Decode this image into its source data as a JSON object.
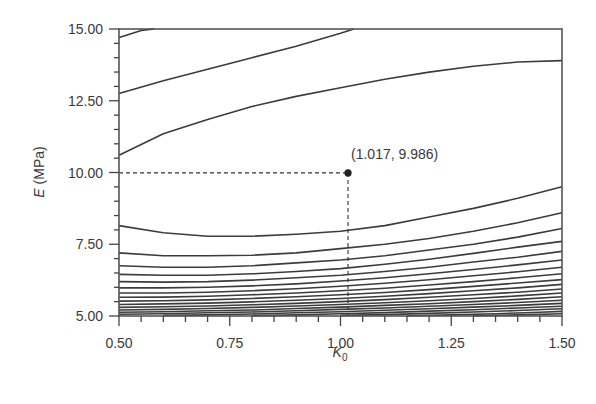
{
  "chart_data": {
    "type": "line",
    "title": "",
    "subtitle": "",
    "xlabel": "K",
    "xlabel_subscript": "0",
    "ylabel_italic": "E",
    "ylabel_unit": " (MPa)",
    "xlim": [
      0.5,
      1.5
    ],
    "ylim": [
      5.0,
      15.0
    ],
    "x_ticks": [
      "0.50",
      "0.75",
      "1.00",
      "1.25",
      "1.50"
    ],
    "x_tick_values": [
      0.5,
      0.75,
      1.0,
      1.25,
      1.5
    ],
    "x_minor_step": 0.05,
    "y_ticks": [
      "5.00",
      "7.50",
      "10.00",
      "12.50",
      "15.00"
    ],
    "y_tick_values": [
      5.0,
      7.5,
      10.0,
      12.5,
      15.0
    ],
    "y_minor_step": 0.5,
    "grid": false,
    "legend": null,
    "annotation": {
      "label": "(1.017, 9.986)",
      "x": 1.017,
      "y": 9.986,
      "guides": "dashed lines to both axes"
    },
    "series": [
      {
        "name": "contour-1",
        "x": [
          0.5,
          0.52,
          0.55,
          0.58
        ],
        "y": [
          14.7,
          14.8,
          14.95,
          15.0
        ]
      },
      {
        "name": "contour-2",
        "x": [
          0.5,
          0.6,
          0.7,
          0.8,
          0.9,
          1.0,
          1.03
        ],
        "y": [
          12.75,
          13.2,
          13.6,
          14.0,
          14.4,
          14.85,
          15.0
        ]
      },
      {
        "name": "contour-3",
        "x": [
          0.5,
          0.6,
          0.7,
          0.8,
          0.9,
          1.0,
          1.1,
          1.2,
          1.3,
          1.4,
          1.5
        ],
        "y": [
          10.6,
          11.35,
          11.85,
          12.3,
          12.65,
          12.95,
          13.25,
          13.5,
          13.7,
          13.85,
          13.9
        ]
      },
      {
        "name": "contour-4",
        "x": [
          0.5,
          0.6,
          0.7,
          0.8,
          0.9,
          1.0,
          1.1,
          1.2,
          1.3,
          1.4,
          1.5
        ],
        "y": [
          8.15,
          7.9,
          7.78,
          7.78,
          7.85,
          7.95,
          8.15,
          8.45,
          8.75,
          9.1,
          9.5
        ]
      },
      {
        "name": "contour-5",
        "x": [
          0.5,
          0.6,
          0.7,
          0.8,
          0.9,
          1.0,
          1.1,
          1.2,
          1.3,
          1.4,
          1.5
        ],
        "y": [
          7.2,
          7.1,
          7.1,
          7.12,
          7.2,
          7.35,
          7.5,
          7.7,
          7.95,
          8.25,
          8.6
        ]
      },
      {
        "name": "contour-6",
        "x": [
          0.5,
          0.6,
          0.7,
          0.8,
          0.9,
          1.0,
          1.1,
          1.2,
          1.3,
          1.4,
          1.5
        ],
        "y": [
          6.75,
          6.7,
          6.7,
          6.75,
          6.85,
          6.95,
          7.1,
          7.3,
          7.5,
          7.75,
          8.05
        ]
      },
      {
        "name": "contour-7",
        "x": [
          0.5,
          0.6,
          0.7,
          0.8,
          0.9,
          1.0,
          1.1,
          1.2,
          1.3,
          1.4,
          1.5
        ],
        "y": [
          6.45,
          6.42,
          6.42,
          6.47,
          6.55,
          6.65,
          6.8,
          6.98,
          7.18,
          7.4,
          7.6
        ]
      },
      {
        "name": "contour-8",
        "x": [
          0.5,
          0.6,
          0.7,
          0.8,
          0.9,
          1.0,
          1.1,
          1.2,
          1.3,
          1.4,
          1.5
        ],
        "y": [
          6.2,
          6.18,
          6.2,
          6.25,
          6.33,
          6.42,
          6.55,
          6.7,
          6.88,
          7.05,
          7.25
        ]
      },
      {
        "name": "contour-9",
        "x": [
          0.5,
          0.6,
          0.7,
          0.8,
          0.9,
          1.0,
          1.1,
          1.2,
          1.3,
          1.4,
          1.5
        ],
        "y": [
          5.98,
          5.98,
          6.0,
          6.05,
          6.12,
          6.22,
          6.33,
          6.47,
          6.62,
          6.78,
          6.95
        ]
      },
      {
        "name": "contour-10",
        "x": [
          0.5,
          0.6,
          0.7,
          0.8,
          0.9,
          1.0,
          1.1,
          1.2,
          1.3,
          1.4,
          1.5
        ],
        "y": [
          5.8,
          5.8,
          5.83,
          5.88,
          5.95,
          6.04,
          6.14,
          6.26,
          6.4,
          6.54,
          6.7
        ]
      },
      {
        "name": "contour-11",
        "x": [
          0.5,
          0.6,
          0.7,
          0.8,
          0.9,
          1.0,
          1.1,
          1.2,
          1.3,
          1.4,
          1.5
        ],
        "y": [
          5.65,
          5.66,
          5.69,
          5.74,
          5.8,
          5.88,
          5.97,
          6.08,
          6.2,
          6.33,
          6.47
        ]
      },
      {
        "name": "contour-12",
        "x": [
          0.5,
          0.6,
          0.7,
          0.8,
          0.9,
          1.0,
          1.1,
          1.2,
          1.3,
          1.4,
          1.5
        ],
        "y": [
          5.52,
          5.53,
          5.56,
          5.61,
          5.67,
          5.74,
          5.82,
          5.92,
          6.03,
          6.15,
          6.27
        ]
      },
      {
        "name": "contour-13",
        "x": [
          0.5,
          0.6,
          0.7,
          0.8,
          0.9,
          1.0,
          1.1,
          1.2,
          1.3,
          1.4,
          1.5
        ],
        "y": [
          5.4,
          5.42,
          5.45,
          5.49,
          5.55,
          5.61,
          5.69,
          5.78,
          5.88,
          5.98,
          6.1
        ]
      },
      {
        "name": "contour-14",
        "x": [
          0.5,
          0.6,
          0.7,
          0.8,
          0.9,
          1.0,
          1.1,
          1.2,
          1.3,
          1.4,
          1.5
        ],
        "y": [
          5.3,
          5.32,
          5.35,
          5.39,
          5.44,
          5.5,
          5.57,
          5.65,
          5.74,
          5.83,
          5.94
        ]
      },
      {
        "name": "contour-15",
        "x": [
          0.5,
          0.6,
          0.7,
          0.8,
          0.9,
          1.0,
          1.1,
          1.2,
          1.3,
          1.4,
          1.5
        ],
        "y": [
          5.21,
          5.23,
          5.26,
          5.3,
          5.35,
          5.4,
          5.46,
          5.53,
          5.61,
          5.7,
          5.8
        ]
      },
      {
        "name": "contour-16",
        "x": [
          0.5,
          0.6,
          0.7,
          0.8,
          0.9,
          1.0,
          1.1,
          1.2,
          1.3,
          1.4,
          1.5
        ],
        "y": [
          5.13,
          5.15,
          5.18,
          5.21,
          5.26,
          5.31,
          5.37,
          5.43,
          5.5,
          5.58,
          5.67
        ]
      },
      {
        "name": "contour-17",
        "x": [
          0.5,
          0.6,
          0.7,
          0.8,
          0.9,
          1.0,
          1.1,
          1.2,
          1.3,
          1.4,
          1.5
        ],
        "y": [
          5.06,
          5.08,
          5.11,
          5.14,
          5.18,
          5.23,
          5.28,
          5.34,
          5.4,
          5.47,
          5.55
        ]
      },
      {
        "name": "contour-18",
        "x": [
          0.6,
          0.7,
          0.8,
          0.9,
          1.0,
          1.1,
          1.2,
          1.3,
          1.4,
          1.5
        ],
        "y": [
          5.02,
          5.04,
          5.07,
          5.11,
          5.15,
          5.2,
          5.25,
          5.31,
          5.37,
          5.44
        ]
      },
      {
        "name": "contour-19",
        "x": [
          0.8,
          0.9,
          1.0,
          1.1,
          1.2,
          1.3,
          1.4,
          1.5
        ],
        "y": [
          5.01,
          5.04,
          5.08,
          5.12,
          5.17,
          5.22,
          5.28,
          5.34
        ]
      },
      {
        "name": "contour-20",
        "x": [
          1.0,
          1.1,
          1.2,
          1.3,
          1.4,
          1.5
        ],
        "y": [
          5.02,
          5.05,
          5.09,
          5.14,
          5.19,
          5.25
        ]
      },
      {
        "name": "contour-21",
        "x": [
          1.15,
          1.25,
          1.35,
          1.45,
          1.5
        ],
        "y": [
          5.01,
          5.04,
          5.08,
          5.13,
          5.16
        ]
      },
      {
        "name": "contour-22",
        "x": [
          1.3,
          1.4,
          1.5
        ],
        "y": [
          5.01,
          5.04,
          5.08
        ]
      }
    ]
  },
  "layout": {
    "plot_left": 119,
    "plot_right": 562,
    "plot_top": 29,
    "plot_bottom": 316
  },
  "colors": {
    "line": "#3c3c3c",
    "frame": "#555555",
    "text": "#3a3a3a",
    "background": "#ffffff"
  }
}
